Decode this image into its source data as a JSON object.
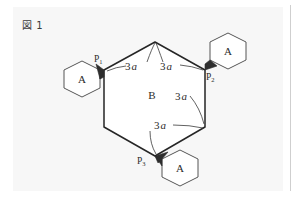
{
  "figure": {
    "caption": "図 1",
    "colors": {
      "background": "#ffffff",
      "panel": "#f7f7f7",
      "stroke": "#262626",
      "wedge_fill": "#2e2e2e",
      "hex_fill": "#ffffff",
      "text": "#2b2b2b",
      "gutter_rule": "#cfcfcf"
    },
    "center_label": "B",
    "edge_labels": [
      {
        "id": "edge-label-top-left",
        "prefix": "3",
        "variable": "a",
        "text": "3a",
        "x": 131,
        "y": 69
      },
      {
        "id": "edge-label-top-right",
        "prefix": "3",
        "variable": "a",
        "text": "3a",
        "x": 165,
        "y": 69
      },
      {
        "id": "edge-label-right",
        "prefix": "3",
        "variable": "a",
        "text": "3a",
        "x": 180,
        "y": 100
      },
      {
        "id": "edge-label-bottom",
        "prefix": "3",
        "variable": "a",
        "text": "3a",
        "x": 158,
        "y": 128
      }
    ],
    "vertex_labels": [
      {
        "id": "vertex-label-p1",
        "base": "P",
        "sub": "1",
        "text": "P1",
        "x": 97,
        "y": 60
      },
      {
        "id": "vertex-label-p2",
        "base": "P",
        "sub": "2",
        "text": "P2",
        "x": 206,
        "y": 78
      },
      {
        "id": "vertex-label-p3",
        "base": "P",
        "sub": "3",
        "text": "P3",
        "x": 140,
        "y": 162
      }
    ],
    "small_hexagons": [
      {
        "id": "hexagon-a-left",
        "label": "A",
        "cx": 82,
        "cy": 79
      },
      {
        "id": "hexagon-a-upper-right",
        "label": "A",
        "cx": 228,
        "cy": 51
      },
      {
        "id": "hexagon-a-bottom",
        "label": "A",
        "cx": 180,
        "cy": 168
      }
    ],
    "large_hexagon": {
      "id": "hexagon-b",
      "label": "B",
      "label_x": 152,
      "label_y": 99,
      "vertices": "155,42 205,70 205,127 155,156 104,127 104,70"
    }
  }
}
